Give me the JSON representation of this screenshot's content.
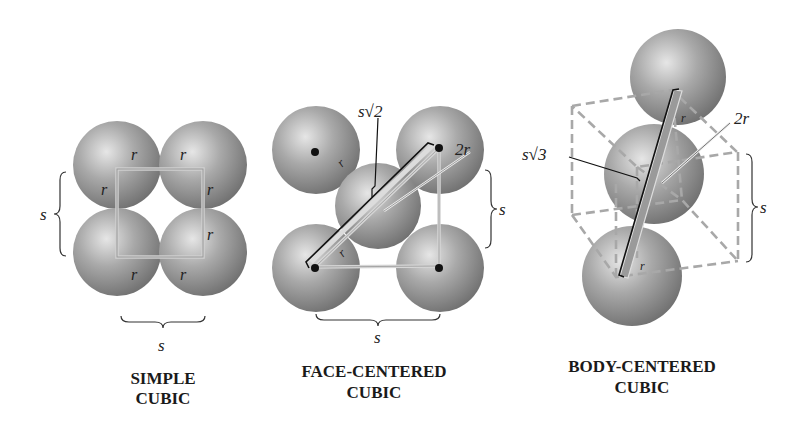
{
  "diagrams": [
    {
      "id": "simple-cubic",
      "caption_line1": "SIMPLE",
      "caption_line2": "CUBIC",
      "labels": {
        "radius": "r",
        "side_left": "s",
        "side_bottom": "s"
      }
    },
    {
      "id": "face-centered-cubic",
      "caption_line1": "FACE-CENTERED",
      "caption_line2": "CUBIC",
      "labels": {
        "diagonal": "s√2",
        "diameter": "2r",
        "radius": "r",
        "side_right": "s",
        "side_bottom": "s"
      }
    },
    {
      "id": "body-centered-cubic",
      "caption_line1": "BODY-CENTERED",
      "caption_line2": "CUBIC",
      "labels": {
        "diagonal": "s√3",
        "diameter": "2r",
        "radius": "r",
        "side_right": "s"
      }
    }
  ],
  "colors": {
    "sphere_dark": "#7a7a7a",
    "sphere_light": "#d8d8d8",
    "outline": "#c8c8c8",
    "text": "#222222"
  }
}
